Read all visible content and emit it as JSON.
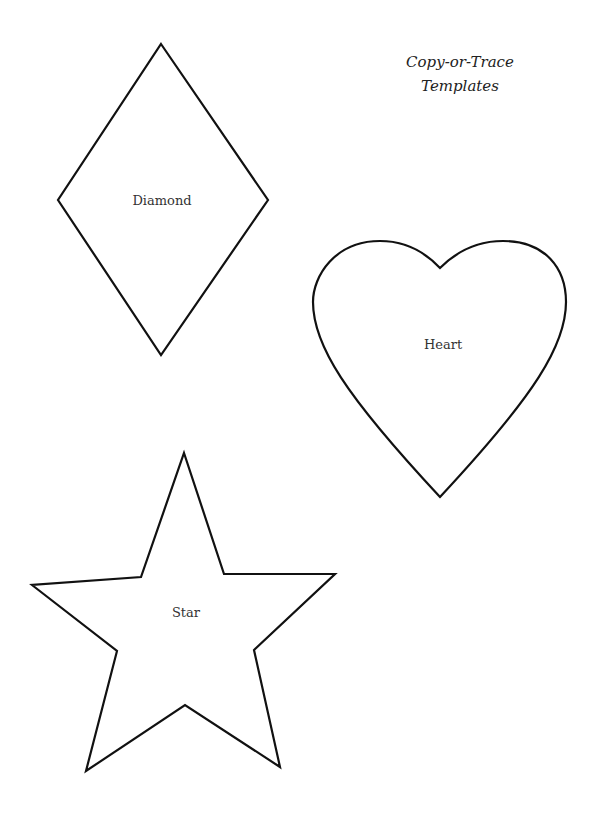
{
  "title": {
    "line1": "Copy-or-Trace",
    "line2": "Templates"
  },
  "shapes": [
    {
      "name": "diamond",
      "label": "Diamond"
    },
    {
      "name": "heart",
      "label": "Heart"
    },
    {
      "name": "star",
      "label": "Star"
    }
  ],
  "colors": {
    "stroke": "#111111",
    "background": "#ffffff",
    "text": "#333333"
  }
}
